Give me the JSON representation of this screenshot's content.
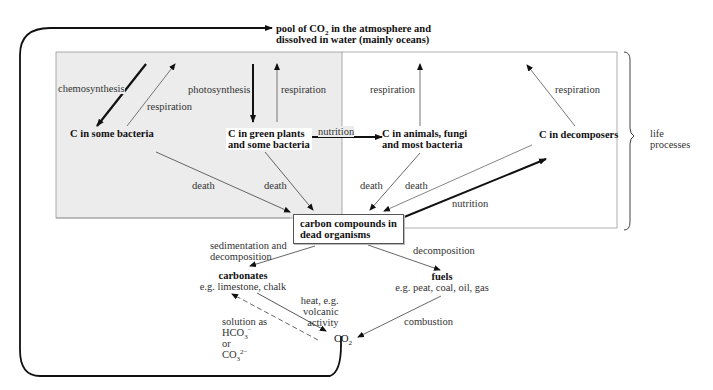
{
  "title_node": {
    "line1_pre": "pool of CO",
    "line1_sub": "2",
    "line1_post": " in the atmosphere and",
    "line2": "dissolved in water (mainly oceans)"
  },
  "nodes": {
    "bacteria": "C in some bacteria",
    "plants_l1": "C in green plants",
    "plants_l2": "and some bacteria",
    "animals_l1": "C in animals, fungi",
    "animals_l2": "and most bacteria",
    "decomposers": "C in decomposers",
    "dead_l1": "carbon compounds in",
    "dead_l2": "dead organisms",
    "carbonates_title": "carbonates",
    "carbonates_eg": "e.g. limestone, chalk",
    "fuels_title": "fuels",
    "fuels_eg": "e.g. peat, coal, oil, gas",
    "co2_pre": "CO",
    "co2_sub": "2"
  },
  "arrow_labels": {
    "chemosynthesis": "chemosynthesis",
    "respiration_bacteria": "respiration",
    "photosynthesis": "photosynthesis",
    "respiration_plants": "respiration",
    "nutrition_plants_animals": "nutrition",
    "respiration_animals": "respiration",
    "respiration_decomposers": "respiration",
    "death_bacteria": "death",
    "death_plants": "death",
    "death_animals": "death",
    "death_decomposers": "death",
    "nutrition_dead_decomposers": "nutrition",
    "sedimentation_l1": "sedimentation and",
    "sedimentation_l2": "decomposition",
    "decomposition": "decomposition",
    "heat_l1": "heat, e.g.",
    "heat_l2": "volcanic",
    "heat_l3": "activity",
    "solution_l1": "solution as",
    "solution_hco3": "HCO",
    "solution_hco3_sub": "3",
    "solution_hco3_sup": "−",
    "solution_or": "or",
    "solution_co3": "CO",
    "solution_co3_sub": "3",
    "solution_co3_sup": "2−",
    "combustion": "combustion"
  },
  "bracket_label": {
    "line1": "life",
    "line2": "processes"
  },
  "colors": {
    "shaded_region": "#ececec",
    "line": "#222222",
    "thin_line": "#777777"
  }
}
